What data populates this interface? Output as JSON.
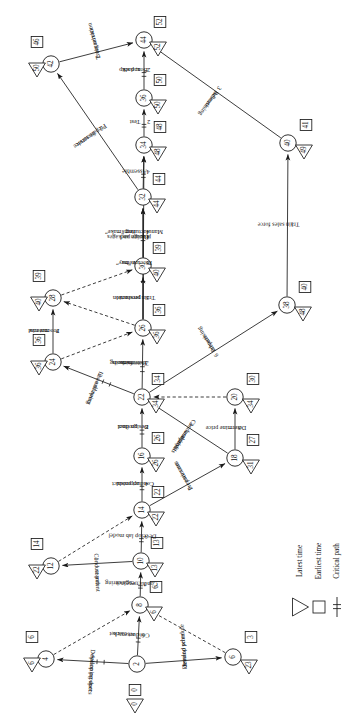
{
  "diagram": {
    "type": "pert-cpm-network",
    "orientation_note": "rotated-90",
    "legend": {
      "latest_time_label": "Latest time",
      "earliest_time_label": "Earliest time",
      "critical_path_label": "Critical path",
      "latest_time_icon": "triangle-icon",
      "earliest_time_icon": "square-icon",
      "critical_path_icon": "hatched-line-icon"
    },
    "nodes": [
      {
        "id": "2",
        "earliest": "0",
        "latest": "0"
      },
      {
        "id": "4",
        "earliest": "6",
        "latest": "6"
      },
      {
        "id": "6",
        "earliest": "3",
        "latest": "23"
      },
      {
        "id": "8",
        "earliest": "6",
        "latest": "6"
      },
      {
        "id": "10",
        "earliest": "13",
        "latest": "13"
      },
      {
        "id": "12",
        "earliest": "14",
        "latest": "22"
      },
      {
        "id": "14",
        "earliest": "22",
        "latest": "22"
      },
      {
        "id": "16",
        "earliest": "26",
        "latest": "26"
      },
      {
        "id": "18",
        "earliest": "27",
        "latest": "31"
      },
      {
        "id": "20",
        "earliest": "30",
        "latest": "34"
      },
      {
        "id": "22",
        "earliest": "34",
        "latest": "34"
      },
      {
        "id": "24",
        "earliest": "36",
        "latest": "36"
      },
      {
        "id": "26",
        "earliest": "36",
        "latest": "36"
      },
      {
        "id": "28",
        "earliest": "39",
        "latest": "40"
      },
      {
        "id": "30",
        "earliest": "39",
        "latest": "40"
      },
      {
        "id": "32",
        "earliest": "44",
        "latest": "44"
      },
      {
        "id": "34",
        "earliest": "48",
        "latest": "48"
      },
      {
        "id": "36",
        "earliest": "50",
        "latest": "50"
      },
      {
        "id": "38",
        "earliest": "40",
        "latest": "48"
      },
      {
        "id": "40",
        "earliest": "41",
        "latest": "49"
      },
      {
        "id": "42",
        "earliest": "46",
        "latest": "50"
      },
      {
        "id": "44",
        "earliest": "52",
        "latest": "52"
      }
    ],
    "activities": [
      {
        "from": "2",
        "to": "4",
        "label": "Develop product planning specs",
        "duration": "6",
        "dummy": false,
        "critical": true
      },
      {
        "from": "2",
        "to": "8",
        "label": "Conduct market research",
        "duration": "6",
        "dummy": false,
        "critical": true
      },
      {
        "from": "2",
        "to": "6",
        "label": "Develop price demand schedule",
        "duration": "3",
        "dummy": false,
        "critical": false
      },
      {
        "from": "4",
        "to": "8",
        "label": "",
        "duration": "0",
        "dummy": true,
        "critical": false
      },
      {
        "from": "6",
        "to": "8",
        "label": "",
        "duration": "0",
        "dummy": true,
        "critical": false
      },
      {
        "from": "8",
        "to": "10",
        "label": "Conduct engineering research",
        "duration": "7",
        "dummy": false,
        "critical": true
      },
      {
        "from": "10",
        "to": "12",
        "label": "Conduct patent search",
        "duration": "1",
        "dummy": false,
        "critical": false
      },
      {
        "from": "10",
        "to": "14",
        "label": "Develop lab model",
        "duration": "9",
        "dummy": false,
        "critical": true
      },
      {
        "from": "12",
        "to": "14",
        "label": "",
        "duration": "0",
        "dummy": true,
        "critical": false
      },
      {
        "from": "14",
        "to": "16",
        "label": "Conduct product appraisal",
        "duration": "4",
        "dummy": false,
        "critical": true
      },
      {
        "from": "14",
        "to": "18",
        "label": "Prepare cost estimates",
        "duration": "5",
        "dummy": false,
        "critical": false
      },
      {
        "from": "16",
        "to": "22",
        "label": "Design final product",
        "duration": "8",
        "dummy": false,
        "critical": true
      },
      {
        "from": "18",
        "to": "22",
        "label": "Conduct profit and loss analysis",
        "duration": "3",
        "dummy": false,
        "critical": false
      },
      {
        "from": "18",
        "to": "20",
        "label": "Determine price",
        "duration": "3",
        "dummy": false,
        "critical": false
      },
      {
        "from": "20",
        "to": "22",
        "label": "",
        "duration": "0",
        "dummy": true,
        "critical": false
      },
      {
        "from": "22",
        "to": "24",
        "label": "Issue drawing and specs",
        "duration": "2",
        "dummy": false,
        "critical": true
      },
      {
        "from": "22",
        "to": "26",
        "label": "Determine manufacturing methods",
        "duration": "2",
        "dummy": false,
        "critical": true
      },
      {
        "from": "22",
        "to": "38",
        "label": "Prepare advertising",
        "duration": "6",
        "dummy": false,
        "critical": false
      },
      {
        "from": "24",
        "to": "26",
        "label": "",
        "duration": "0",
        "dummy": true,
        "critical": false
      },
      {
        "from": "24",
        "to": "28",
        "label": "Procure raw material",
        "duration": "3",
        "dummy": false,
        "critical": false
      },
      {
        "from": "26",
        "to": "28",
        "label": "",
        "duration": "0",
        "dummy": true,
        "critical": false
      },
      {
        "from": "26",
        "to": "30",
        "label": "Train production personnel",
        "duration": "3",
        "dummy": false,
        "critical": false
      },
      {
        "from": "26",
        "to": "32",
        "label": "Procure “buy” items",
        "duration": "8",
        "dummy": false,
        "critical": true
      },
      {
        "from": "26",
        "to": "34",
        "label": "Design and procure packages",
        "duration": "4",
        "dummy": false,
        "critical": false
      },
      {
        "from": "28",
        "to": "30",
        "label": "",
        "duration": "0",
        "dummy": true,
        "critical": false
      },
      {
        "from": "30",
        "to": "32",
        "label": "Manufacturing “make” items",
        "duration": "4",
        "dummy": false,
        "critical": true
      },
      {
        "from": "32",
        "to": "34",
        "label": "Assemble",
        "duration": "4",
        "dummy": false,
        "critical": true
      },
      {
        "from": "32",
        "to": "42",
        "label": "Prepare service literature",
        "duration": "2",
        "dummy": false,
        "critical": false
      },
      {
        "from": "34",
        "to": "36",
        "label": "Test",
        "duration": "2",
        "dummy": false,
        "critical": true
      },
      {
        "from": "36",
        "to": "44",
        "label": "Box, pack and ship",
        "duration": "2",
        "dummy": false,
        "critical": true
      },
      {
        "from": "38",
        "to": "40",
        "label": "Train sales force",
        "duration": "1",
        "dummy": false,
        "critical": false
      },
      {
        "from": "40",
        "to": "44",
        "label": "Release advertising",
        "duration": "3",
        "dummy": false,
        "critical": false
      },
      {
        "from": "42",
        "to": "44",
        "label": "Train service organization",
        "duration": "2",
        "dummy": false,
        "critical": false
      }
    ]
  }
}
